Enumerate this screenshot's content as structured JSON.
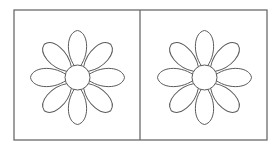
{
  "figure": {
    "colors": {
      "background": "#ffffff",
      "frame_stroke": "#6b6b6b",
      "flower_stroke": "#5a5a5a",
      "fill": "#ffffff"
    },
    "frame": {
      "x": 14,
      "y": 10,
      "width": 253,
      "height": 130,
      "divider_x": 140
    },
    "panels": [
      {
        "id": "left",
        "flower": {
          "cx": 77.5,
          "cy": 77.5,
          "center_radius": 12.5,
          "petal_count": 8,
          "petal_length": 47,
          "petal_half_width": 9.5
        }
      },
      {
        "id": "right",
        "flower": {
          "cx": 204.5,
          "cy": 77.5,
          "center_radius": 12.5,
          "petal_count": 8,
          "petal_length": 47,
          "petal_half_width": 9.5
        }
      }
    ]
  }
}
